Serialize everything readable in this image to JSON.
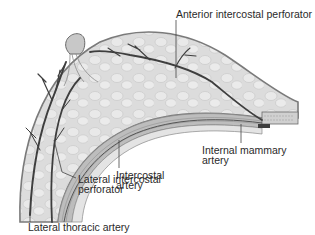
{
  "figure": {
    "labels": {
      "anterior_intercostal_perforator": "Anterior intercostal perforator",
      "intercostal_artery": [
        "Intercostal",
        "artery"
      ],
      "internal_mammary_artery": [
        "Internal mammary",
        "artery"
      ],
      "lateral_intercostal_perforator": [
        "Lateral intercostal",
        "perforator"
      ],
      "lateral_thoracic_artery": "Lateral thoracic artery"
    },
    "colors": {
      "background": "#ffffff",
      "skin_outline": "#7a7a7a",
      "tissue_fill": "#dcdcdc",
      "lobule_fill": "#e9e9e9",
      "vessel": "#3e3e3e",
      "muscle_band": "#b8b8b8",
      "leader_line": "#444444",
      "label_text": "#2a2a2a"
    }
  }
}
